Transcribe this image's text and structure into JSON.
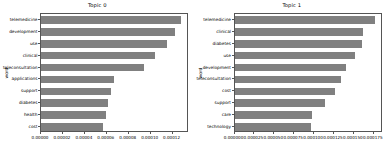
{
  "chart_data": [
    {
      "type": "bar",
      "orientation": "horizontal",
      "title": "Topic 0",
      "xlabel": "",
      "ylabel": "word",
      "categories": [
        "telemedicine",
        "development",
        "use",
        "clinical",
        "teleconsultation",
        "applications",
        "support",
        "diabetes",
        "health",
        "cost"
      ],
      "values": [
        0.000128,
        0.000122,
        0.000115,
        0.000104,
        9.35e-05,
        6.65e-05,
        6.35e-05,
        6.15e-05,
        5.95e-05,
        5.65e-05
      ],
      "xlim": [
        0.0,
        0.000135
      ],
      "xticks": [
        0.0,
        2e-05,
        4e-05,
        6e-05,
        8e-05,
        0.0001,
        0.00012
      ],
      "xticklabels": [
        "0.00000",
        "0.00002",
        "0.00004",
        "0.00006",
        "0.00008",
        "0.00010",
        "0.00012"
      ],
      "grid": false,
      "bar_color": "#808080"
    },
    {
      "type": "bar",
      "orientation": "horizontal",
      "title": "Topic 1",
      "xlabel": "",
      "ylabel": "word",
      "categories": [
        "telemedicine",
        "clinical",
        "diabetes",
        "use",
        "development",
        "teleconsultation",
        "cost",
        "support",
        "care",
        "technology"
      ],
      "values": [
        0.000176,
        0.000162,
        0.00016,
        0.000152,
        0.00014,
        0.000134,
        0.000126,
        0.000114,
        9.75e-05,
        9.65e-05
      ],
      "xlim": [
        0.0,
        0.000186
      ],
      "xticks": [
        0.0,
        2.5e-05,
        5e-05,
        7.5e-05,
        0.0001,
        0.000125,
        0.00015,
        0.000175
      ],
      "xticklabels": [
        "0.000000",
        "0.000025",
        "0.000050",
        "0.000075",
        "0.000100",
        "0.000125",
        "0.000150",
        "0.000175"
      ],
      "grid": false,
      "bar_color": "#808080"
    }
  ]
}
